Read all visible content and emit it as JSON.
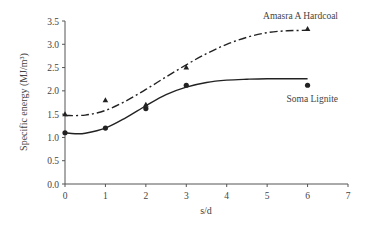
{
  "chart_data": {
    "type": "scatter",
    "title": "",
    "xlabel": "s/d",
    "ylabel": "Specific energy (MJ/m³)",
    "xlim": [
      0,
      7
    ],
    "ylim": [
      0,
      3.5
    ],
    "x_ticks": [
      "0",
      "1",
      "2",
      "3",
      "4",
      "5",
      "6",
      "7"
    ],
    "y_ticks": [
      "0.0",
      "0.5",
      "1.0",
      "1.5",
      "2.0",
      "2.5",
      "3.0",
      "3.5"
    ],
    "grid": false,
    "legend": "inline labels",
    "series": [
      {
        "name": "Amasra A Hardcoal",
        "marker": "triangle",
        "line_style": "dash-dot",
        "x": [
          0,
          1,
          2,
          3,
          6
        ],
        "values": [
          1.5,
          1.8,
          1.7,
          2.5,
          3.33
        ],
        "fit_curve": [
          [
            0,
            1.47
          ],
          [
            0.5,
            1.48
          ],
          [
            1,
            1.58
          ],
          [
            1.5,
            1.78
          ],
          [
            2,
            2.03
          ],
          [
            2.5,
            2.3
          ],
          [
            3,
            2.56
          ],
          [
            3.5,
            2.8
          ],
          [
            4,
            3.0
          ],
          [
            4.5,
            3.15
          ],
          [
            5,
            3.25
          ],
          [
            5.5,
            3.29
          ],
          [
            6,
            3.3
          ]
        ]
      },
      {
        "name": "Soma Lignite",
        "marker": "circle",
        "line_style": "solid",
        "x": [
          0,
          1,
          2,
          3,
          6
        ],
        "values": [
          1.1,
          1.2,
          1.62,
          2.12,
          2.12
        ],
        "fit_curve": [
          [
            0,
            1.1
          ],
          [
            0.25,
            1.08
          ],
          [
            0.5,
            1.09
          ],
          [
            1,
            1.2
          ],
          [
            1.5,
            1.42
          ],
          [
            2,
            1.68
          ],
          [
            2.5,
            1.92
          ],
          [
            3,
            2.08
          ],
          [
            3.5,
            2.18
          ],
          [
            4,
            2.23
          ],
          [
            4.5,
            2.25
          ],
          [
            5,
            2.26
          ],
          [
            6,
            2.26
          ]
        ]
      }
    ],
    "colors": {
      "axis": "#555555",
      "series": "#222222"
    }
  }
}
